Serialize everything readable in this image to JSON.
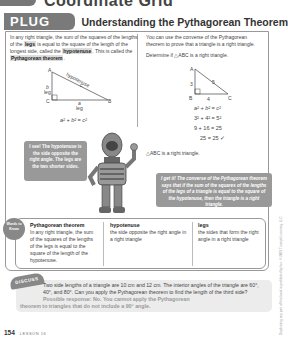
{
  "top_banner": {
    "title": "Coordinate Grid"
  },
  "plug_in": {
    "badge": "PLUG IN",
    "title": "Understanding the Pythagorean Theorem"
  },
  "left_column": {
    "text_1": "In any right triangle, the sum of the squares of the lengths of the ",
    "legs": "legs",
    "text_2": " is equal to the square of the length of the longest side, called the ",
    "hypotenuse": "hypotenuse",
    "text_3": ". This is called the ",
    "theorem": "Pythagorean theorem",
    "text_4": ".",
    "diagram": {
      "vertex_a": "A",
      "vertex_b": "B",
      "vertex_c": "C",
      "side_b": "b",
      "side_b_label": "leg",
      "side_a": "a",
      "side_a_label": "leg",
      "side_c": "c",
      "side_c_label": "hypotenuse",
      "formula": "a² + b² = c²"
    }
  },
  "right_column": {
    "intro": "You can use the converse of the Pythagorean theorem to prove that a triangle is a right triangle.",
    "prompt": "Determine if △ABC is a right triangle.",
    "diagram": {
      "vertex_a": "A",
      "vertex_b": "B",
      "vertex_c": "C",
      "side_ab": "3",
      "side_bc": "4",
      "side_ac": "5"
    },
    "steps": [
      "a² + b² = c²",
      "3² + 4² = 5²",
      "9 + 16 = 25",
      "25 = 25 ✓"
    ],
    "conclusion": "△ABC is a right triangle."
  },
  "bubbles": {
    "left": "I see! The hypotenuse is the side opposite the right angle. The legs are the two shorter sides.",
    "right": "I get it! The converse of the Pythagorean theorem says that if the sum of the squares of the lengths of the legs of a triangle is equal to the square of the hypotenuse, then the triangle is a right triangle."
  },
  "words_to_know": {
    "badge": "Words to Know",
    "terms": [
      {
        "term": "Pythagorean theorem",
        "definition": "In any right triangle, the sum of the squares of the lengths of the legs is equal to the square of the length of the hypotenuse."
      },
      {
        "term": "hypotenuse",
        "definition": "the side opposite the right angle in a right triangle"
      },
      {
        "term": "legs",
        "definition": "the sides that form the right angle in a right triangle"
      }
    ]
  },
  "discuss": {
    "badge": "DISCUSS",
    "question": "Two side lengths of a triangle are 10 cm and 12 cm. The interior angles of the triangle are 60°, 40°, and 80°. Can you apply the Pythagorean theorem to find the length of the third side?",
    "answer_1": "Possible response: No. You cannot apply the Pythagorean",
    "answer_2": "theorem to triangles that do not include a 90° angle."
  },
  "footer": {
    "page_number": "154",
    "lesson": "LESSON 16"
  },
  "side_copyright": "Duplicating any part of this book is prohibited by law. © 2019 Triumph Learning, LLC"
}
